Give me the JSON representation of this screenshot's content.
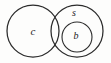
{
  "diagram": {
    "type": "euler-set-diagram",
    "canvas": {
      "width": 111,
      "height": 63,
      "background": "#fdfdfc"
    },
    "style": {
      "stroke_color": "#2b2b2b",
      "label_color": "#1c1c1c",
      "stroke_width": 1.25,
      "inner_stroke_width": 1.1
    },
    "sets": [
      {
        "id": "c",
        "label": "c",
        "role": "left-set",
        "shape": "circle",
        "cx": 33,
        "cy": 31,
        "r": 26,
        "label_x": 33,
        "label_y": 32,
        "label_font_size": 11
      },
      {
        "id": "s",
        "label": "s",
        "role": "right-set",
        "shape": "circle",
        "cx": 77,
        "cy": 31,
        "r": 26,
        "label_x": 74,
        "label_y": 14,
        "label_font_size": 10
      },
      {
        "id": "b",
        "label": "b",
        "role": "inner-set",
        "shape": "circle",
        "cx": 77,
        "cy": 37,
        "r": 15,
        "label_x": 76,
        "label_y": 37,
        "label_font_size": 10
      }
    ],
    "relations": [
      {
        "kind": "overlap",
        "from": "c",
        "to": "s"
      },
      {
        "kind": "containment",
        "from": "b",
        "to": "s"
      }
    ]
  }
}
